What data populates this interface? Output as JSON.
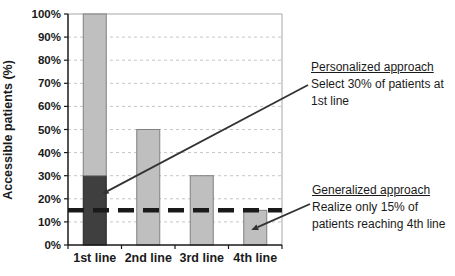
{
  "chart_data": {
    "type": "bar",
    "stacked": true,
    "title": "",
    "xlabel": "",
    "ylabel": "Accessible patients (%)",
    "ylim": [
      0,
      100
    ],
    "ytick_step": 10,
    "ytick_labels": [
      "0%",
      "10%",
      "20%",
      "30%",
      "40%",
      "50%",
      "60%",
      "70%",
      "80%",
      "90%",
      "100%"
    ],
    "grid": true,
    "legend": "none",
    "categories": [
      "1st line",
      "2nd line",
      "3rd line",
      "4th line"
    ],
    "series": [
      {
        "name": "selected-patients-dark",
        "values": [
          30,
          0,
          0,
          0
        ],
        "color": "#3f3f3f",
        "border": "#262626"
      },
      {
        "name": "accessible-patients-light",
        "values": [
          70,
          50,
          30,
          15
        ],
        "color": "#bfbfbf",
        "border": "#808080"
      }
    ],
    "bar_totals": [
      100,
      50,
      30,
      15
    ],
    "threshold_line": {
      "value": 15,
      "style": "dashed",
      "color": "#1a1a1a"
    }
  },
  "annotations": {
    "personalized": {
      "title": "Personalized approach",
      "line1": "Select 30% of patients at",
      "line2": "1st line",
      "target": {
        "category_index": 0,
        "value_pct": 22
      }
    },
    "generalized": {
      "title": "Generalized approach",
      "line1": "Realize only 15% of",
      "line2": "patients reaching 4th line",
      "target": {
        "category_index": 3,
        "value_pct": 6.5
      }
    }
  },
  "colors": {
    "grid": "#c6c6c6",
    "plot_border": "#a6a6a6",
    "axis": "#1a1a1a",
    "text": "#1a1a1a",
    "threshold": "#1a1a1a",
    "leader": "#333333",
    "background": "#ffffff"
  }
}
